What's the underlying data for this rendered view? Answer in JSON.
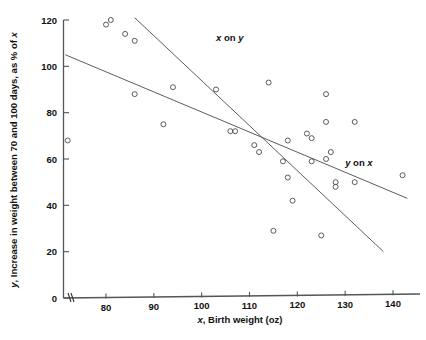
{
  "chart_data": {
    "type": "scatter",
    "title": "",
    "xlabel": "x, Birth weight (oz)",
    "ylabel": "y, Increase in weight between 70 and 100 days, as % of x",
    "xlabel_parts": {
      "sym": "x",
      "rest": ", Birth weight (oz)"
    },
    "ylabel_parts": {
      "sym": "y",
      "rest": ", Increase in weight between 70 and 100 days, as % of x",
      "tail_sym": "x"
    },
    "xlim": [
      71,
      145
    ],
    "ylim": [
      0,
      122
    ],
    "xticks": [
      80,
      90,
      100,
      110,
      120,
      130,
      140
    ],
    "yticks": [
      0,
      20,
      40,
      60,
      80,
      100,
      120
    ],
    "grid": false,
    "legend": "inline-annotations",
    "axis_break": "x-axis break near origin",
    "marker_style": "open circle",
    "points": [
      {
        "x": 72,
        "y": 68
      },
      {
        "x": 80,
        "y": 118
      },
      {
        "x": 81,
        "y": 120
      },
      {
        "x": 84,
        "y": 114
      },
      {
        "x": 86,
        "y": 111
      },
      {
        "x": 86,
        "y": 88
      },
      {
        "x": 92,
        "y": 75
      },
      {
        "x": 94,
        "y": 91
      },
      {
        "x": 103,
        "y": 90
      },
      {
        "x": 106,
        "y": 72
      },
      {
        "x": 107,
        "y": 72
      },
      {
        "x": 111,
        "y": 66
      },
      {
        "x": 112,
        "y": 63
      },
      {
        "x": 114,
        "y": 93
      },
      {
        "x": 115,
        "y": 29
      },
      {
        "x": 117,
        "y": 59
      },
      {
        "x": 118,
        "y": 68
      },
      {
        "x": 118,
        "y": 52
      },
      {
        "x": 119,
        "y": 42
      },
      {
        "x": 122,
        "y": 71
      },
      {
        "x": 123,
        "y": 69
      },
      {
        "x": 123,
        "y": 59
      },
      {
        "x": 125,
        "y": 27
      },
      {
        "x": 126,
        "y": 88
      },
      {
        "x": 126,
        "y": 76
      },
      {
        "x": 126,
        "y": 60
      },
      {
        "x": 127,
        "y": 63
      },
      {
        "x": 128,
        "y": 50
      },
      {
        "x": 128,
        "y": 48
      },
      {
        "x": 132,
        "y": 76
      },
      {
        "x": 132,
        "y": 50
      },
      {
        "x": 142,
        "y": 53
      }
    ],
    "lines": [
      {
        "name": "x on y",
        "label": "x on y",
        "label_sym": "x",
        "label_rest": " on ",
        "label_sym2": "y",
        "x1": 86,
        "y1": 121,
        "x2": 138,
        "y2": 20
      },
      {
        "name": "y on x",
        "label": "y on x",
        "label_sym": "y",
        "label_rest": " on ",
        "label_sym2": "x",
        "x1": 71.5,
        "y1": 105,
        "x2": 143,
        "y2": 43
      }
    ],
    "annotations": [
      {
        "text": "x on y",
        "x": 103,
        "y": 111
      },
      {
        "text": "y on x",
        "x": 130,
        "y": 57
      }
    ]
  }
}
